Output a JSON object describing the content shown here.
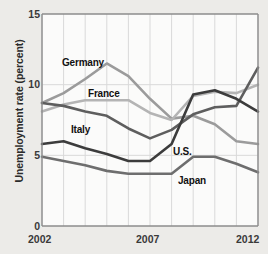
{
  "chart_data": {
    "type": "line",
    "title": "",
    "xlabel": "",
    "ylabel": "Unemployment rate (percent)",
    "xlim": [
      2002,
      2012
    ],
    "ylim": [
      0,
      15
    ],
    "yticks": [
      0,
      5,
      10,
      15
    ],
    "xticks": [
      2002,
      2007,
      2012
    ],
    "grid": true,
    "legend_position": "inline-annotations",
    "x": [
      2002,
      2003,
      2004,
      2005,
      2006,
      2007,
      2008,
      2009,
      2010,
      2011,
      2012
    ],
    "series": [
      {
        "name": "Germany",
        "color": "#9b9b9b",
        "values": [
          8.7,
          9.4,
          10.4,
          11.5,
          10.6,
          9.0,
          7.6,
          7.8,
          7.2,
          6.0,
          5.8
        ]
      },
      {
        "name": "France",
        "color": "#b4b4b4",
        "values": [
          8.1,
          8.6,
          8.9,
          8.9,
          8.9,
          8.0,
          7.5,
          9.2,
          9.5,
          9.4,
          10.0
        ]
      },
      {
        "name": "Italy",
        "color": "#5e5e5e",
        "values": [
          8.7,
          8.5,
          8.1,
          7.8,
          6.9,
          6.2,
          6.8,
          7.9,
          8.4,
          8.5,
          11.2
        ]
      },
      {
        "name": "U.S.",
        "color": "#3c3c3c",
        "values": [
          5.8,
          6.0,
          5.5,
          5.1,
          4.6,
          4.6,
          5.8,
          9.3,
          9.6,
          9.0,
          8.1
        ]
      },
      {
        "name": "Japan",
        "color": "#6e6e6e",
        "values": [
          4.9,
          4.6,
          4.3,
          3.9,
          3.7,
          3.7,
          3.7,
          4.9,
          4.9,
          4.4,
          3.8
        ]
      }
    ],
    "annotations": [
      {
        "text": "Germany",
        "x_px": 62,
        "y_px": 57
      },
      {
        "text": "France",
        "x_px": 88,
        "y_px": 88
      },
      {
        "text": "Italy",
        "x_px": 71,
        "y_px": 124
      },
      {
        "text": "U.S.",
        "x_px": 173,
        "y_px": 146
      },
      {
        "text": "Japan",
        "x_px": 178,
        "y_px": 175
      }
    ]
  },
  "axis": {
    "y_title": "Unemployment rate (percent)",
    "y_ticks": [
      "15",
      "10",
      "5",
      "0"
    ],
    "x_ticks": [
      "2002",
      "2007",
      "2012"
    ]
  },
  "colors": {
    "background": "#ecebe8",
    "plot_background": "#fbfbfa",
    "grid": "#d9d9d9",
    "frame": "#8d8d8d",
    "text": "#2b2b2b"
  }
}
